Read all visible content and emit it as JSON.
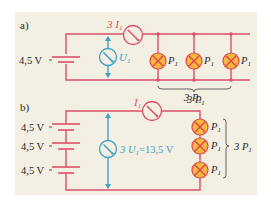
{
  "colors": {
    "background": "#f3efe2",
    "wire": "#d9506b",
    "voltmeter": "#3fa2c4",
    "lamp_fill": "#f5b93e",
    "lamp_stroke": "#e0464e",
    "text": "#2a2a2a",
    "brace": "#555555"
  },
  "part_a": {
    "label": "a)",
    "battery_voltage": "4,5 V",
    "ammeter_label": "3 I",
    "ammeter_sub": "1",
    "voltmeter_label": "U",
    "voltmeter_sub": "1",
    "lamps": [
      {
        "label": "P",
        "sub": "1"
      },
      {
        "label": "P",
        "sub": "1"
      },
      {
        "label": "P",
        "sub": "1"
      }
    ],
    "brace_label": "3 P",
    "brace_sub": "1"
  },
  "part_b": {
    "label": "b)",
    "batteries": [
      "4,5 V",
      "4,5 V",
      "4,5 V"
    ],
    "ammeter_label": "I",
    "ammeter_sub": "1",
    "voltmeter_label": "3 U",
    "voltmeter_sub": "1",
    "voltmeter_value": "=13,5 V",
    "top_label": "3 P",
    "top_sub": "1",
    "lamps": [
      {
        "label": "P",
        "sub": "1"
      },
      {
        "label": "P",
        "sub": "1"
      },
      {
        "label": "P",
        "sub": "1"
      }
    ],
    "brace_label": "3 P",
    "brace_sub": "1"
  }
}
